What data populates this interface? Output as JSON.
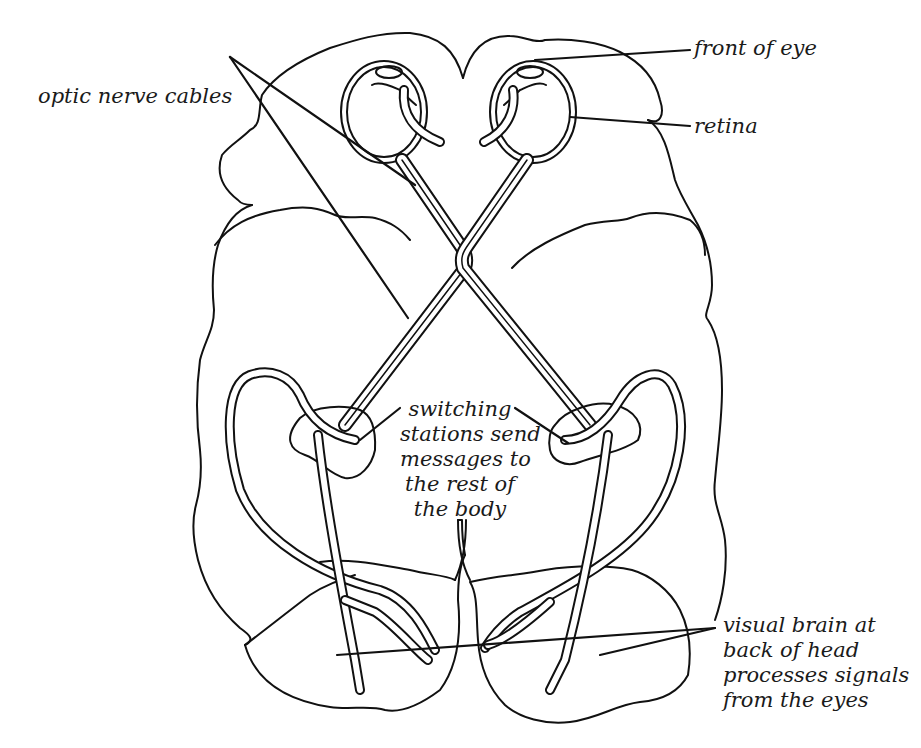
{
  "diagram": {
    "colors": {
      "line": "#111111",
      "background": "#ffffff",
      "text": "#1a1a1a"
    },
    "labels": {
      "front_of_eye": "front of eye",
      "retina": "retina",
      "optic_nerve_cables": "optic nerve cables",
      "switching_stations": [
        "switching",
        "stations send",
        "messages to",
        "the rest of",
        "the body"
      ],
      "visual_brain": [
        "visual brain at",
        "back of head",
        "processes signals",
        "from the eyes"
      ]
    }
  }
}
